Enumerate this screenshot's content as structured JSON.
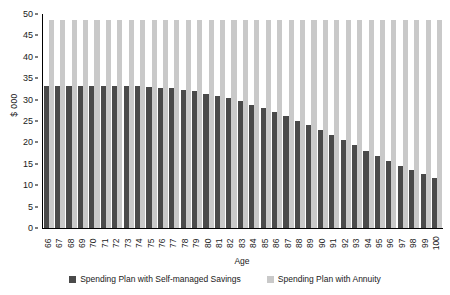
{
  "chart_data": {
    "type": "bar",
    "title": "",
    "xlabel": "Age",
    "ylabel": "$ 000",
    "ylim": [
      0,
      50
    ],
    "yticks": [
      0,
      5,
      10,
      15,
      20,
      25,
      30,
      35,
      40,
      45,
      50
    ],
    "grid": false,
    "legend_position": "bottom",
    "categories": [
      "66",
      "67",
      "68",
      "69",
      "70",
      "71",
      "72",
      "73",
      "74",
      "75",
      "76",
      "77",
      "78",
      "79",
      "80",
      "81",
      "82",
      "83",
      "84",
      "85",
      "86",
      "87",
      "88",
      "89",
      "90",
      "91",
      "92",
      "93",
      "94",
      "95",
      "96",
      "97",
      "98",
      "99",
      "100"
    ],
    "series": [
      {
        "name": "Spending Plan with Self-managed Savings",
        "color": "#4a4a4a",
        "values": [
          33.2,
          33.2,
          33.2,
          33.2,
          33.2,
          33.2,
          33.2,
          33.2,
          33.1,
          33.0,
          32.8,
          32.6,
          32.3,
          31.9,
          31.4,
          30.9,
          30.3,
          29.6,
          28.8,
          28.0,
          27.1,
          26.1,
          25.1,
          24.0,
          22.9,
          21.7,
          20.5,
          19.3,
          18.1,
          16.9,
          15.7,
          14.6,
          13.6,
          12.6,
          11.7
        ]
      },
      {
        "name": "Spending Plan with Annuity",
        "color": "#c9c9c9",
        "values": [
          48.5,
          48.5,
          48.5,
          48.5,
          48.5,
          48.5,
          48.5,
          48.5,
          48.5,
          48.5,
          48.5,
          48.5,
          48.5,
          48.5,
          48.5,
          48.5,
          48.5,
          48.5,
          48.5,
          48.5,
          48.5,
          48.5,
          48.5,
          48.5,
          48.5,
          48.5,
          48.5,
          48.5,
          48.5,
          48.5,
          48.5,
          48.5,
          48.5,
          48.5,
          48.5
        ]
      }
    ]
  }
}
